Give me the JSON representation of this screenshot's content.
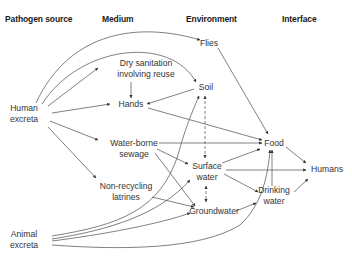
{
  "headers": {
    "pathogen_source": "Pathogen source",
    "medium": "Medium",
    "environment": "Environment",
    "interface": "Interface"
  },
  "nodes": {
    "human_excreta": [
      "Human",
      "excreta"
    ],
    "animal_excreta": [
      "Animal",
      "excreta"
    ],
    "dry_sanitation": [
      "Dry sanitation",
      "involving reuse"
    ],
    "hands": [
      "Hands"
    ],
    "water_borne_sewage": [
      "Water-borne",
      "sewage"
    ],
    "non_recycling_latrines": [
      "Non-recycling",
      "latrines"
    ],
    "flies": [
      "Flies"
    ],
    "soil": [
      "Soil"
    ],
    "surface_water": [
      "Surface",
      "water"
    ],
    "groundwater": [
      "Groundwater"
    ],
    "food": [
      "Food"
    ],
    "drinking_water": [
      "Drinking",
      "water"
    ],
    "humans": [
      "Humans"
    ]
  },
  "edges": [
    {
      "from": "Human excreta",
      "to": "Flies"
    },
    {
      "from": "Human excreta",
      "to": "Soil"
    },
    {
      "from": "Human excreta",
      "to": "Dry sanitation involving reuse"
    },
    {
      "from": "Human excreta",
      "to": "Hands"
    },
    {
      "from": "Human excreta",
      "to": "Water-borne sewage"
    },
    {
      "from": "Human excreta",
      "to": "Non-recycling latrines"
    },
    {
      "from": "Dry sanitation involving reuse",
      "to": "Hands"
    },
    {
      "from": "Soil",
      "to": "Hands"
    },
    {
      "from": "Hands",
      "to": "Food"
    },
    {
      "from": "Flies",
      "to": "Food"
    },
    {
      "from": "Water-borne sewage",
      "to": "Food"
    },
    {
      "from": "Water-borne sewage",
      "to": "Surface water"
    },
    {
      "from": "Water-borne sewage",
      "to": "Groundwater"
    },
    {
      "from": "Non-recycling latrines",
      "to": "Groundwater"
    },
    {
      "from": "Soil",
      "to": "Surface water",
      "style": "dashed",
      "bidirectional": true
    },
    {
      "from": "Surface water",
      "to": "Groundwater",
      "style": "dashed",
      "bidirectional": true
    },
    {
      "from": "Surface water",
      "to": "Food"
    },
    {
      "from": "Surface water",
      "to": "Humans"
    },
    {
      "from": "Surface water",
      "to": "Drinking water"
    },
    {
      "from": "Groundwater",
      "to": "Drinking water"
    },
    {
      "from": "Drinking water",
      "to": "Food"
    },
    {
      "from": "Drinking water",
      "to": "Humans"
    },
    {
      "from": "Food",
      "to": "Humans"
    },
    {
      "from": "Animal excreta",
      "to": "Soil"
    },
    {
      "from": "Animal excreta",
      "to": "Surface water"
    },
    {
      "from": "Animal excreta",
      "to": "Groundwater"
    },
    {
      "from": "Animal excreta",
      "to": "Food"
    }
  ]
}
